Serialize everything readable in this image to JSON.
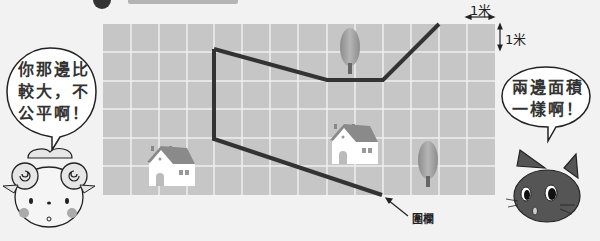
{
  "title": {
    "visible": "cropped"
  },
  "grid": {
    "origin": [
      103,
      24
    ],
    "cell_size": 28,
    "columns": 14,
    "rows": 6,
    "fill": "#c6c6c6",
    "line_color": "#f0f0f0"
  },
  "scale": {
    "horizontal_label": "1米",
    "vertical_label": "1米"
  },
  "fence": {
    "label": "圍欄",
    "color": "#333333",
    "path": [
      [
        214,
        49
      ],
      [
        214,
        139
      ],
      [
        382,
        195
      ]
    ],
    "path_upper": [
      [
        214,
        49
      ],
      [
        327,
        80
      ],
      [
        383,
        80
      ],
      [
        439,
        24
      ]
    ]
  },
  "objects": [
    {
      "type": "house",
      "x": 147,
      "y": 142
    },
    {
      "type": "house",
      "x": 330,
      "y": 120
    },
    {
      "type": "tree",
      "x": 350,
      "y": 30
    },
    {
      "type": "tree",
      "x": 425,
      "y": 140
    }
  ],
  "characters": {
    "sheep": {
      "speech": [
        "你那邊比",
        "較大，不",
        "公平啊！"
      ]
    },
    "cat": {
      "speech": [
        "兩邊面積",
        "一樣啊！"
      ]
    }
  }
}
